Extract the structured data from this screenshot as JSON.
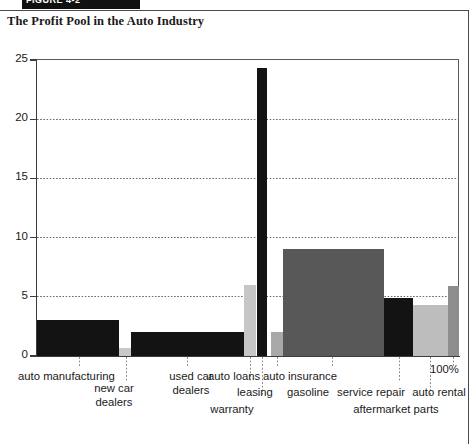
{
  "header": {
    "strip_label": "FIGURE 4-2"
  },
  "figure": {
    "title": "The Profit Pool in the Auto Industry",
    "axis_end_label": "100%"
  },
  "chart_data": {
    "type": "bar",
    "title": "The Profit Pool in the Auto Industry",
    "xlabel": "",
    "ylabel": "",
    "ylim": [
      0,
      25
    ],
    "xlim": [
      0,
      100
    ],
    "yticks": [
      "0",
      "5",
      "10",
      "15",
      "20",
      "25"
    ],
    "grid": "horizontal-dotted",
    "legend": "none",
    "note": "Profit-pool map: bar width = share of industry revenue (cumulative to 100%), bar height = operating margin (%).",
    "categories": [
      "auto manufacturing",
      "new car dealers",
      "used car dealers",
      "leasing",
      "warranty",
      "gasoline",
      "auto insurance",
      "service repair",
      "aftermarket parts",
      "auto rental"
    ],
    "values": [
      3.0,
      0.7,
      2.0,
      6.0,
      24.3,
      2.0,
      9.0,
      4.9,
      4.3,
      5.9
    ],
    "widths": [
      19.5,
      2.8,
      26.8,
      2.8,
      2.4,
      2.8,
      24.0,
      6.9,
      8.1,
      2.9
    ],
    "colors": [
      "#131313",
      "#c8c8c8",
      "#131313",
      "#c6c6c6",
      "#131313",
      "#a8a8a8",
      "#585858",
      "#131313",
      "#bdbdbd",
      "#8d8d8d"
    ],
    "bars": [
      {
        "label": "auto manufacturing",
        "value": 3.0,
        "x_start": 0.0,
        "x_end": 19.5,
        "color": "#131313"
      },
      {
        "label": "new car dealers",
        "value": 0.7,
        "x_start": 19.5,
        "x_end": 22.3,
        "color": "#c8c8c8"
      },
      {
        "label": "used car dealers",
        "value": 2.0,
        "x_start": 22.3,
        "x_end": 49.1,
        "color": "#131313"
      },
      {
        "label": "leasing",
        "value": 6.0,
        "x_start": 49.1,
        "x_end": 51.9,
        "color": "#c6c6c6"
      },
      {
        "label": "warranty",
        "value": 24.3,
        "x_start": 52.1,
        "x_end": 54.5,
        "color": "#131313"
      },
      {
        "label": "gasoline",
        "value": 2.0,
        "x_start": 55.5,
        "x_end": 58.3,
        "color": "#a8a8a8"
      },
      {
        "label": "auto insurance",
        "value": 9.0,
        "x_start": 58.3,
        "x_end": 82.3,
        "color": "#585858"
      },
      {
        "label": "service repair",
        "value": 4.9,
        "x_start": 82.3,
        "x_end": 89.2,
        "color": "#131313"
      },
      {
        "label": "aftermarket parts",
        "value": 4.3,
        "x_start": 89.2,
        "x_end": 97.3,
        "color": "#bdbdbd"
      },
      {
        "label": "auto rental",
        "value": 5.9,
        "x_start": 97.3,
        "x_end": 100.0,
        "color": "#8d8d8d"
      }
    ]
  }
}
